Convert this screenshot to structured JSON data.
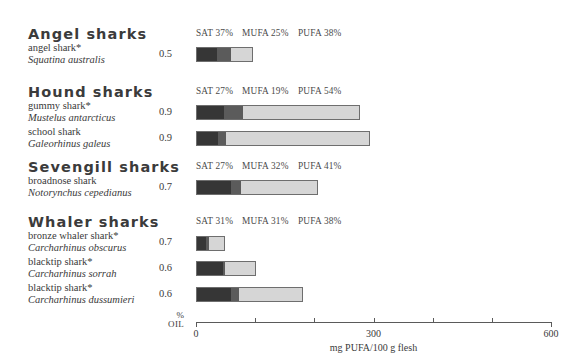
{
  "chart_data": {
    "type": "bar",
    "title": "",
    "xlabel": "mg PUFA/100 g flesh",
    "ylabel": "",
    "xlim": [
      0,
      600
    ],
    "xticks": [
      0,
      100,
      200,
      300,
      400,
      500,
      600
    ],
    "xticklabels": [
      "0",
      "",
      "",
      "300",
      "",
      "",
      "600"
    ],
    "grid": false,
    "legend": "none",
    "stacked": true,
    "segment_names": [
      "SAT",
      "MUFA",
      "PUFA"
    ],
    "oil_axis_label_top": "%",
    "oil_axis_label_bottom": "OIL",
    "groups": [
      {
        "group": "Angel sharks",
        "percent_label": {
          "sat": "SAT 37%",
          "mufa": "MUFA 25%",
          "pufa": "PUFA  38%"
        },
        "percents": {
          "sat": 37,
          "mufa": 25,
          "pufa": 38
        },
        "species": [
          {
            "common": "angel shark*",
            "latin": "Squatina australis",
            "oil_percent": "0.5",
            "total_mg": 96,
            "segments_mg": [
              35,
              25,
              36
            ]
          }
        ]
      },
      {
        "group": "Hound sharks",
        "percent_label": {
          "sat": "SAT 27%",
          "mufa": "MUFA 19%",
          "pufa": "PUFA  54%"
        },
        "percents": {
          "sat": 27,
          "mufa": 19,
          "pufa": 54
        },
        "species": [
          {
            "common": "gummy shark*",
            "latin": "Mustelus antarcticus",
            "oil_percent": "0.9",
            "total_mg": 277,
            "segments_mg": [
              47,
              32,
              198
            ]
          },
          {
            "common": "school shark",
            "latin": "Galeorhinus galeus",
            "oil_percent": "0.9",
            "total_mg": 294,
            "segments_mg": [
              36,
              13,
              245
            ]
          }
        ]
      },
      {
        "group": "Sevengill sharks",
        "percent_label": {
          "sat": "SAT 27%",
          "mufa": "MUFA 32%",
          "pufa": "PUFA  41%"
        },
        "percents": {
          "sat": 27,
          "mufa": 32,
          "pufa": 41
        },
        "species": [
          {
            "common": "broadnose shark",
            "latin": "Notorynchus cepedianus",
            "oil_percent": "0.7",
            "total_mg": 206,
            "segments_mg": [
              59,
              17,
              130
            ]
          }
        ]
      },
      {
        "group": "Whaler sharks",
        "percent_label": {
          "sat": "SAT 31%",
          "mufa": "MUFA 31%",
          "pufa": "PUFA  38%"
        },
        "percents": {
          "sat": 31,
          "mufa": 31,
          "pufa": 38
        },
        "species": [
          {
            "common": "bronze whaler shark*",
            "latin": "Carcharhinus obscurus",
            "oil_percent": "0.7",
            "total_mg": 49,
            "segments_mg": [
              17,
              5,
              27
            ]
          },
          {
            "common": "blacktip shark*",
            "latin": "Carcharhinus sorrah",
            "oil_percent": "0.6",
            "total_mg": 101,
            "segments_mg": [
              45,
              4,
              52
            ]
          },
          {
            "common": "blacktip shark*",
            "latin": "Carcharhinus dussumieri",
            "oil_percent": "0.6",
            "total_mg": 181,
            "segments_mg": [
              59,
              13,
              109
            ]
          }
        ]
      }
    ]
  },
  "colors": {
    "sat": "#363636",
    "mufa": "#5b5b5b",
    "pufa": "#d6d6d6",
    "axis": "#5a5a5a",
    "text": "#3a3a3a"
  }
}
